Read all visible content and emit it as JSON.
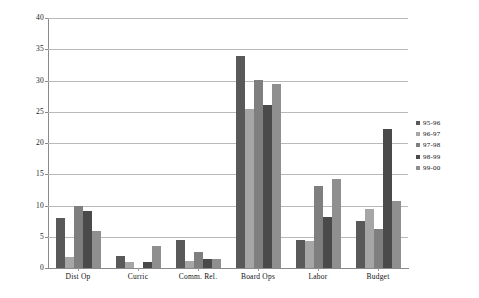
{
  "chart_data": {
    "type": "bar",
    "title": "",
    "subtitle": "",
    "xlabel": "",
    "ylabel": "",
    "ylim": [
      0,
      40
    ],
    "ytick_step": 5,
    "yticks": [
      "0",
      "5",
      "10",
      "15",
      "20",
      "25",
      "30",
      "35",
      "40"
    ],
    "grid": true,
    "grid_axis": "y",
    "legend_position": "right",
    "categories": [
      "Dist Op",
      "Curric",
      "Comm. Rel.",
      "Board Ops",
      "Labor",
      "Budget"
    ],
    "series": [
      {
        "name": "95-96",
        "color": "#595959",
        "values": [
          8.0,
          2.0,
          4.5,
          34.0,
          4.5,
          7.5
        ]
      },
      {
        "name": "96-97",
        "color": "#a6a6a6",
        "values": [
          1.8,
          1.0,
          1.2,
          25.4,
          4.3,
          9.5
        ]
      },
      {
        "name": "97-98",
        "color": "#7f7f7f",
        "values": [
          10.0,
          0.0,
          2.5,
          30.1,
          13.2,
          6.3
        ]
      },
      {
        "name": "98-99",
        "color": "#4a4a4a",
        "values": [
          9.1,
          1.0,
          1.4,
          26.1,
          8.1,
          22.3
        ]
      },
      {
        "name": "99-00",
        "color": "#8f8f8f",
        "values": [
          6.0,
          3.5,
          1.4,
          29.4,
          14.2,
          10.8
        ]
      }
    ]
  },
  "legend": {
    "entries": [
      "95-96",
      "96-97",
      "97-98",
      "98-99",
      "99-00"
    ]
  },
  "colors": {
    "axis": "#8a8a8a",
    "gridline": "#b9b9b9",
    "background": "#ffffff",
    "text": "#111111"
  }
}
